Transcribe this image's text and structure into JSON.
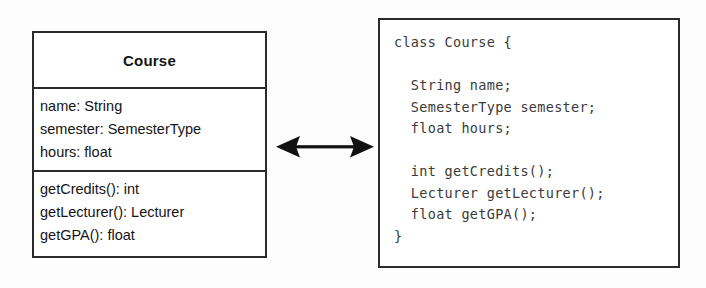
{
  "diagram": {
    "uml_class": {
      "name": "Course",
      "attributes": [
        "name: String",
        "semester: SemesterType",
        "hours: float"
      ],
      "operations": [
        "getCredits(): int",
        "getLecturer(): Lecturer",
        "getGPA(): float"
      ]
    },
    "connector": {
      "icon": "double-headed-arrow-icon",
      "color": "#111111"
    },
    "code_block": {
      "language": "java",
      "lines": [
        "class Course {",
        "",
        "  String name;",
        "  SemesterType semester;",
        "  float hours;",
        "",
        "  int getCredits();",
        "  Lecturer getLecturer();",
        "  float getGPA();",
        "}"
      ]
    }
  },
  "colors": {
    "stroke": "#2b2b2b",
    "text": "#141414",
    "code_text": "#3a3a3a",
    "background": "#fdfdfd"
  }
}
